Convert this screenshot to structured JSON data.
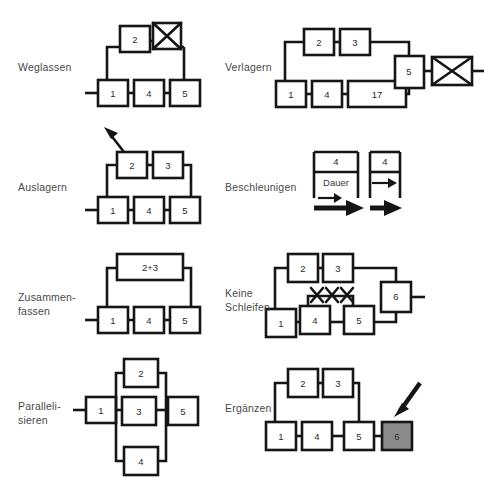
{
  "page": {
    "background": "#ffffff",
    "ink": "#151515",
    "text_color": "#4a4a4a",
    "highlight_fill": "#8c8c8c",
    "width": 489,
    "height": 483
  },
  "panels": [
    {
      "id": "weglassen",
      "label": "Weglassen",
      "label_lines": [
        "Weglassen"
      ],
      "nodes": [
        {
          "name": "node-1",
          "text": "1"
        },
        {
          "name": "node-4",
          "text": "4"
        },
        {
          "name": "node-5",
          "text": "5"
        },
        {
          "name": "node-2",
          "text": "2"
        },
        {
          "name": "node-crossed",
          "text": ""
        }
      ],
      "annotation": "crossed-out-box"
    },
    {
      "id": "verlagern",
      "label": "Verlagern",
      "label_lines": [
        "Verlagern"
      ],
      "nodes": [
        {
          "name": "node-1",
          "text": "1"
        },
        {
          "name": "node-4",
          "text": "4"
        },
        {
          "name": "node-17",
          "text": "17"
        },
        {
          "name": "node-2",
          "text": "2"
        },
        {
          "name": "node-3",
          "text": "3"
        },
        {
          "name": "node-5",
          "text": "5"
        },
        {
          "name": "node-crossed",
          "text": ""
        }
      ],
      "annotation": "crossed-out-box"
    },
    {
      "id": "auslagern",
      "label": "Auslagern",
      "label_lines": [
        "Auslagern"
      ],
      "nodes": [
        {
          "name": "node-1",
          "text": "1"
        },
        {
          "name": "node-4",
          "text": "4"
        },
        {
          "name": "node-5",
          "text": "5"
        },
        {
          "name": "node-2",
          "text": "2"
        },
        {
          "name": "node-3",
          "text": "3"
        }
      ],
      "annotation": "outgoing-arrow-up-left"
    },
    {
      "id": "beschleunigen",
      "label": "Beschleunigen",
      "label_lines": [
        "Beschleunigen"
      ],
      "nodes": [
        {
          "name": "node-4-long",
          "text": "4"
        },
        {
          "name": "node-4-short",
          "text": "4"
        }
      ],
      "duration_label": "Dauer",
      "annotation": "duration-compression-arrows"
    },
    {
      "id": "zusammenfassen",
      "label": "Zusammen-\nfassen",
      "label_lines": [
        "Zusammen-",
        "fassen"
      ],
      "nodes": [
        {
          "name": "node-1",
          "text": "1"
        },
        {
          "name": "node-4",
          "text": "4"
        },
        {
          "name": "node-5",
          "text": "5"
        },
        {
          "name": "node-merged",
          "text": "2+3"
        }
      ],
      "annotation": "merged-node"
    },
    {
      "id": "keine-schleifen",
      "label": "Keine\nSchleifen",
      "label_lines": [
        "Keine",
        "Schleifen"
      ],
      "nodes": [
        {
          "name": "node-1",
          "text": "1"
        },
        {
          "name": "node-4",
          "text": "4"
        },
        {
          "name": "node-5",
          "text": "5"
        },
        {
          "name": "node-2",
          "text": "2"
        },
        {
          "name": "node-3",
          "text": "3"
        },
        {
          "name": "node-6",
          "text": "6"
        }
      ],
      "annotation": "loop-crossed-out-xxx"
    },
    {
      "id": "parallelisieren",
      "label": "Paralleli-\nsieren",
      "label_lines": [
        "Paralleli-",
        "sieren"
      ],
      "nodes": [
        {
          "name": "node-1",
          "text": "1"
        },
        {
          "name": "node-2",
          "text": "2"
        },
        {
          "name": "node-3",
          "text": "3"
        },
        {
          "name": "node-4",
          "text": "4"
        },
        {
          "name": "node-5",
          "text": "5"
        }
      ],
      "annotation": "parallel-branches"
    },
    {
      "id": "erganzen",
      "label": "Ergänzen",
      "label_lines": [
        "Ergänzen"
      ],
      "nodes": [
        {
          "name": "node-1",
          "text": "1"
        },
        {
          "name": "node-4",
          "text": "4"
        },
        {
          "name": "node-5",
          "text": "5"
        },
        {
          "name": "node-2",
          "text": "2"
        },
        {
          "name": "node-3",
          "text": "3"
        },
        {
          "name": "node-6-added",
          "text": "6"
        }
      ],
      "annotation": "incoming-arrow-to-new-node"
    }
  ]
}
